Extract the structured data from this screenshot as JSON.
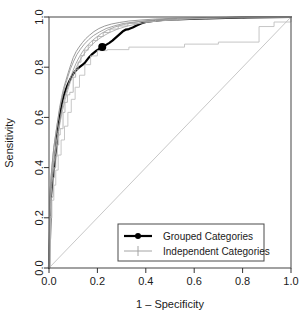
{
  "chart_data": {
    "type": "line",
    "title": "",
    "xlabel": "1 – Specificity",
    "ylabel": "Sensitivity",
    "xlim": [
      0.0,
      1.0
    ],
    "ylim": [
      0.0,
      1.0
    ],
    "grid": false,
    "xticks": [
      "0.0",
      "0.2",
      "0.4",
      "0.6",
      "0.8",
      "1.0"
    ],
    "xtick_values": [
      0.0,
      0.2,
      0.4,
      0.6,
      0.8,
      1.0
    ],
    "yticks": [
      "0.0",
      "0.2",
      "0.4",
      "0.6",
      "0.8",
      "1.0"
    ],
    "ytick_values": [
      0.0,
      0.2,
      0.4,
      0.6,
      0.8,
      1.0
    ],
    "legend_position": "bottom-right-inside",
    "legend": [
      {
        "label": "Grouped Categories",
        "marker": "filled-circle",
        "color": "#000000",
        "width": 2.2
      },
      {
        "label": "Independent Categories",
        "marker": "plus",
        "color": "#9a9a9a",
        "width": 0.9
      }
    ],
    "reference_line": {
      "name": "chance-diagonal",
      "from": [
        0.0,
        0.0
      ],
      "to": [
        1.0,
        1.0
      ],
      "color": "#c8c8c8"
    },
    "operating_point": {
      "name": "grouped-operating-point",
      "x": 0.22,
      "y": 0.88,
      "color": "#000000"
    },
    "series": [
      {
        "name": "Grouped Categories",
        "color": "#000000",
        "width": 2.2,
        "points": [
          [
            0.0,
            0.0
          ],
          [
            0.004,
            0.12
          ],
          [
            0.006,
            0.215
          ],
          [
            0.008,
            0.285
          ],
          [
            0.012,
            0.33
          ],
          [
            0.016,
            0.36
          ],
          [
            0.02,
            0.392
          ],
          [
            0.024,
            0.42
          ],
          [
            0.026,
            0.452
          ],
          [
            0.03,
            0.48
          ],
          [
            0.032,
            0.512
          ],
          [
            0.036,
            0.545
          ],
          [
            0.04,
            0.572
          ],
          [
            0.044,
            0.6
          ],
          [
            0.048,
            0.625
          ],
          [
            0.052,
            0.648
          ],
          [
            0.056,
            0.668
          ],
          [
            0.062,
            0.69
          ],
          [
            0.068,
            0.706
          ],
          [
            0.074,
            0.722
          ],
          [
            0.082,
            0.74
          ],
          [
            0.09,
            0.756
          ],
          [
            0.098,
            0.77
          ],
          [
            0.106,
            0.782
          ],
          [
            0.116,
            0.792
          ],
          [
            0.126,
            0.8
          ],
          [
            0.134,
            0.806
          ],
          [
            0.142,
            0.812
          ],
          [
            0.15,
            0.82
          ],
          [
            0.158,
            0.83
          ],
          [
            0.166,
            0.84
          ],
          [
            0.176,
            0.85
          ],
          [
            0.186,
            0.858
          ],
          [
            0.196,
            0.866
          ],
          [
            0.206,
            0.872
          ],
          [
            0.22,
            0.88
          ],
          [
            0.234,
            0.888
          ],
          [
            0.248,
            0.896
          ],
          [
            0.262,
            0.906
          ],
          [
            0.276,
            0.918
          ],
          [
            0.29,
            0.93
          ],
          [
            0.304,
            0.942
          ],
          [
            0.318,
            0.95
          ],
          [
            0.33,
            0.952
          ],
          [
            0.346,
            0.958
          ],
          [
            0.362,
            0.966
          ],
          [
            0.38,
            0.974
          ],
          [
            0.4,
            0.98
          ],
          [
            0.43,
            0.984
          ],
          [
            0.47,
            0.988
          ],
          [
            0.52,
            0.99
          ],
          [
            0.58,
            0.992
          ],
          [
            0.65,
            0.994
          ],
          [
            0.73,
            0.996
          ],
          [
            0.82,
            0.998
          ],
          [
            0.91,
            0.999
          ],
          [
            1.0,
            1.0
          ]
        ]
      },
      {
        "name": "Independent Categories fold 1",
        "color": "#8f8f8f",
        "width": 0.9,
        "points": [
          [
            0.0,
            0.0
          ],
          [
            0.002,
            0.19
          ],
          [
            0.004,
            0.3
          ],
          [
            0.008,
            0.355
          ],
          [
            0.012,
            0.4
          ],
          [
            0.016,
            0.44
          ],
          [
            0.02,
            0.48
          ],
          [
            0.026,
            0.52
          ],
          [
            0.032,
            0.56
          ],
          [
            0.038,
            0.6
          ],
          [
            0.044,
            0.64
          ],
          [
            0.052,
            0.68
          ],
          [
            0.06,
            0.715
          ],
          [
            0.07,
            0.748
          ],
          [
            0.08,
            0.78
          ],
          [
            0.09,
            0.81
          ],
          [
            0.1,
            0.838
          ],
          [
            0.112,
            0.862
          ],
          [
            0.124,
            0.88
          ],
          [
            0.138,
            0.898
          ],
          [
            0.152,
            0.914
          ],
          [
            0.168,
            0.928
          ],
          [
            0.186,
            0.942
          ],
          [
            0.206,
            0.954
          ],
          [
            0.23,
            0.964
          ],
          [
            0.258,
            0.972
          ],
          [
            0.29,
            0.978
          ],
          [
            0.33,
            0.984
          ],
          [
            0.38,
            0.988
          ],
          [
            0.44,
            0.992
          ],
          [
            0.52,
            0.995
          ],
          [
            0.62,
            0.997
          ],
          [
            0.74,
            0.999
          ],
          [
            0.88,
            1.0
          ],
          [
            1.0,
            1.0
          ]
        ]
      },
      {
        "name": "Independent Categories fold 2",
        "color": "#a0a0a0",
        "width": 0.9,
        "points": [
          [
            0.0,
            0.0
          ],
          [
            0.003,
            0.15
          ],
          [
            0.006,
            0.27
          ],
          [
            0.01,
            0.34
          ],
          [
            0.014,
            0.382
          ],
          [
            0.018,
            0.42
          ],
          [
            0.024,
            0.462
          ],
          [
            0.03,
            0.5
          ],
          [
            0.036,
            0.54
          ],
          [
            0.042,
            0.578
          ],
          [
            0.05,
            0.618
          ],
          [
            0.058,
            0.655
          ],
          [
            0.068,
            0.692
          ],
          [
            0.078,
            0.725
          ],
          [
            0.088,
            0.756
          ],
          [
            0.1,
            0.788
          ],
          [
            0.112,
            0.816
          ],
          [
            0.126,
            0.842
          ],
          [
            0.14,
            0.864
          ],
          [
            0.156,
            0.884
          ],
          [
            0.174,
            0.902
          ],
          [
            0.194,
            0.918
          ],
          [
            0.216,
            0.934
          ],
          [
            0.242,
            0.948
          ],
          [
            0.272,
            0.96
          ],
          [
            0.308,
            0.97
          ],
          [
            0.35,
            0.978
          ],
          [
            0.4,
            0.984
          ],
          [
            0.47,
            0.989
          ],
          [
            0.56,
            0.993
          ],
          [
            0.67,
            0.996
          ],
          [
            0.8,
            0.999
          ],
          [
            1.0,
            1.0
          ]
        ]
      },
      {
        "name": "Independent Categories fold 3",
        "color": "#b0b0b0",
        "width": 0.9,
        "step": true,
        "points": [
          [
            0.0,
            0.0
          ],
          [
            0.004,
            0.205
          ],
          [
            0.01,
            0.28
          ],
          [
            0.014,
            0.285
          ],
          [
            0.018,
            0.36
          ],
          [
            0.022,
            0.4
          ],
          [
            0.028,
            0.445
          ],
          [
            0.034,
            0.49
          ],
          [
            0.04,
            0.53
          ],
          [
            0.046,
            0.555
          ],
          [
            0.056,
            0.555
          ],
          [
            0.058,
            0.62
          ],
          [
            0.066,
            0.66
          ],
          [
            0.076,
            0.69
          ],
          [
            0.086,
            0.7
          ],
          [
            0.096,
            0.7
          ],
          [
            0.1,
            0.76
          ],
          [
            0.11,
            0.79
          ],
          [
            0.12,
            0.82
          ],
          [
            0.132,
            0.846
          ],
          [
            0.146,
            0.868
          ],
          [
            0.162,
            0.888
          ],
          [
            0.18,
            0.906
          ],
          [
            0.2,
            0.922
          ],
          [
            0.224,
            0.938
          ],
          [
            0.252,
            0.952
          ],
          [
            0.286,
            0.964
          ],
          [
            0.326,
            0.974
          ],
          [
            0.376,
            0.982
          ],
          [
            0.44,
            0.988
          ],
          [
            0.53,
            0.993
          ],
          [
            0.65,
            0.997
          ],
          [
            0.8,
            0.999
          ],
          [
            1.0,
            1.0
          ]
        ]
      },
      {
        "name": "Independent Categories fold 4",
        "color": "#989898",
        "width": 0.9,
        "points": [
          [
            0.0,
            0.0
          ],
          [
            0.002,
            0.23
          ],
          [
            0.005,
            0.31
          ],
          [
            0.009,
            0.37
          ],
          [
            0.013,
            0.415
          ],
          [
            0.017,
            0.455
          ],
          [
            0.022,
            0.495
          ],
          [
            0.028,
            0.535
          ],
          [
            0.034,
            0.575
          ],
          [
            0.041,
            0.615
          ],
          [
            0.049,
            0.655
          ],
          [
            0.058,
            0.692
          ],
          [
            0.067,
            0.728
          ],
          [
            0.078,
            0.762
          ],
          [
            0.089,
            0.794
          ],
          [
            0.102,
            0.824
          ],
          [
            0.115,
            0.85
          ],
          [
            0.13,
            0.872
          ],
          [
            0.146,
            0.892
          ],
          [
            0.164,
            0.91
          ],
          [
            0.184,
            0.926
          ],
          [
            0.208,
            0.94
          ],
          [
            0.236,
            0.954
          ],
          [
            0.268,
            0.964
          ],
          [
            0.306,
            0.974
          ],
          [
            0.352,
            0.98
          ],
          [
            0.41,
            0.986
          ],
          [
            0.485,
            0.991
          ],
          [
            0.58,
            0.994
          ],
          [
            0.7,
            0.997
          ],
          [
            0.85,
            0.999
          ],
          [
            1.0,
            1.0
          ]
        ]
      },
      {
        "name": "Independent Categories fold 5 outlier",
        "color": "#c0c0c0",
        "width": 0.9,
        "step": true,
        "points": [
          [
            0.0,
            0.0
          ],
          [
            0.006,
            0.2
          ],
          [
            0.012,
            0.27
          ],
          [
            0.02,
            0.33
          ],
          [
            0.028,
            0.39
          ],
          [
            0.038,
            0.45
          ],
          [
            0.05,
            0.51
          ],
          [
            0.064,
            0.565
          ],
          [
            0.078,
            0.62
          ],
          [
            0.092,
            0.672
          ],
          [
            0.108,
            0.72
          ],
          [
            0.126,
            0.768
          ],
          [
            0.148,
            0.81
          ],
          [
            0.172,
            0.845
          ],
          [
            0.2,
            0.866
          ],
          [
            0.24,
            0.87
          ],
          [
            0.33,
            0.87
          ],
          [
            0.33,
            0.88
          ],
          [
            0.56,
            0.88
          ],
          [
            0.56,
            0.892
          ],
          [
            0.7,
            0.892
          ],
          [
            0.7,
            0.9
          ],
          [
            0.868,
            0.9
          ],
          [
            0.868,
            0.962
          ],
          [
            0.93,
            0.962
          ],
          [
            0.93,
            0.98
          ],
          [
            1.0,
            0.98
          ],
          [
            1.0,
            1.0
          ]
        ]
      },
      {
        "name": "Independent Categories fold 6",
        "color": "#adadad",
        "width": 0.9,
        "points": [
          [
            0.0,
            0.0
          ],
          [
            0.003,
            0.17
          ],
          [
            0.007,
            0.26
          ],
          [
            0.011,
            0.32
          ],
          [
            0.016,
            0.372
          ],
          [
            0.021,
            0.418
          ],
          [
            0.027,
            0.462
          ],
          [
            0.033,
            0.505
          ],
          [
            0.04,
            0.548
          ],
          [
            0.048,
            0.59
          ],
          [
            0.057,
            0.632
          ],
          [
            0.067,
            0.672
          ],
          [
            0.078,
            0.71
          ],
          [
            0.09,
            0.746
          ],
          [
            0.104,
            0.78
          ],
          [
            0.118,
            0.81
          ],
          [
            0.134,
            0.838
          ],
          [
            0.152,
            0.862
          ],
          [
            0.172,
            0.884
          ],
          [
            0.194,
            0.904
          ],
          [
            0.22,
            0.922
          ],
          [
            0.25,
            0.938
          ],
          [
            0.284,
            0.952
          ],
          [
            0.324,
            0.964
          ],
          [
            0.372,
            0.974
          ],
          [
            0.43,
            0.982
          ],
          [
            0.505,
            0.988
          ],
          [
            0.6,
            0.993
          ],
          [
            0.72,
            0.997
          ],
          [
            0.87,
            0.999
          ],
          [
            1.0,
            1.0
          ]
        ]
      }
    ]
  },
  "axes": {
    "x_title": "1 – Specificity",
    "y_title": "Sensitivity"
  }
}
